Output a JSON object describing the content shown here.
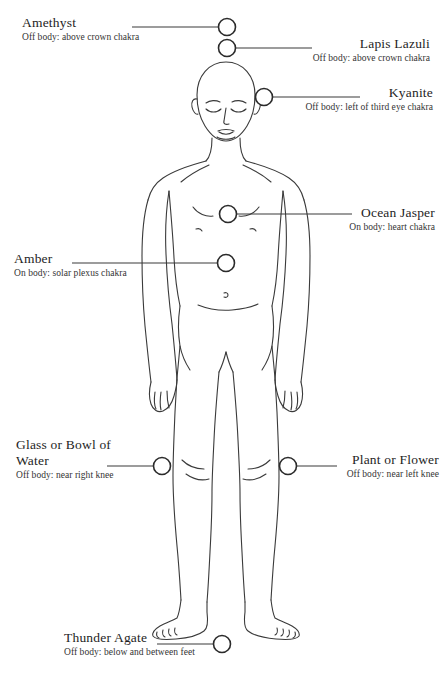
{
  "diagram": {
    "figure_name": "human-body-outline",
    "line_color": "#3a3a3a",
    "marker_color": "#2b2b2b",
    "background_color": "#ffffff"
  },
  "callouts": [
    {
      "id": "amethyst",
      "title": "Amethyst",
      "desc": "Off body: above crown chakra",
      "align": "left",
      "marker": {
        "cx": 227,
        "cy": 27,
        "r": 8.5
      },
      "leader": {
        "x1": 132,
        "y1": 27,
        "x2": 218,
        "y2": 27
      }
    },
    {
      "id": "lapis-lazuli",
      "title": "Lapis Lazuli",
      "desc": "Off body: above crown chakra",
      "align": "right",
      "marker": {
        "cx": 227,
        "cy": 48,
        "r": 8.5
      },
      "leader": {
        "x1": 236,
        "y1": 48,
        "x2": 312,
        "y2": 48
      }
    },
    {
      "id": "kyanite",
      "title": "Kyanite",
      "desc": "Off body: left of third eye chakra",
      "align": "right",
      "marker": {
        "cx": 264,
        "cy": 97,
        "r": 8.5
      },
      "leader": {
        "x1": 273,
        "y1": 97,
        "x2": 360,
        "y2": 97
      }
    },
    {
      "id": "ocean-jasper",
      "title": "Ocean Jasper",
      "desc": "On body: heart chakra",
      "align": "right",
      "marker": {
        "cx": 228,
        "cy": 214,
        "r": 8.5
      },
      "leader": {
        "x1": 237,
        "y1": 214,
        "x2": 352,
        "y2": 214
      }
    },
    {
      "id": "amber",
      "title": "Amber",
      "desc": "On body: solar plexus chakra",
      "align": "left",
      "marker": {
        "cx": 226,
        "cy": 263,
        "r": 8.5
      },
      "leader": {
        "x1": 72,
        "y1": 263,
        "x2": 217,
        "y2": 263
      }
    },
    {
      "id": "glass-or-bowl-of-water",
      "title": "Glass or Bowl of Water",
      "desc": "Off body: near right knee",
      "align": "left",
      "marker": {
        "cx": 162,
        "cy": 466,
        "r": 8.5
      },
      "leader": {
        "x1": 107,
        "y1": 466,
        "x2": 153,
        "y2": 466
      }
    },
    {
      "id": "plant-or-flower",
      "title": "Plant or Flower",
      "desc": "Off body: near left knee",
      "align": "right",
      "marker": {
        "cx": 288,
        "cy": 466,
        "r": 8.5
      },
      "leader": {
        "x1": 297,
        "y1": 466,
        "x2": 337,
        "y2": 466
      }
    },
    {
      "id": "thunder-agate",
      "title": "Thunder Agate",
      "desc": "Off body: below and between feet",
      "align": "left",
      "marker": {
        "cx": 222,
        "cy": 644,
        "r": 8.5
      },
      "leader": {
        "x1": 157,
        "y1": 644,
        "x2": 213,
        "y2": 644
      }
    }
  ]
}
